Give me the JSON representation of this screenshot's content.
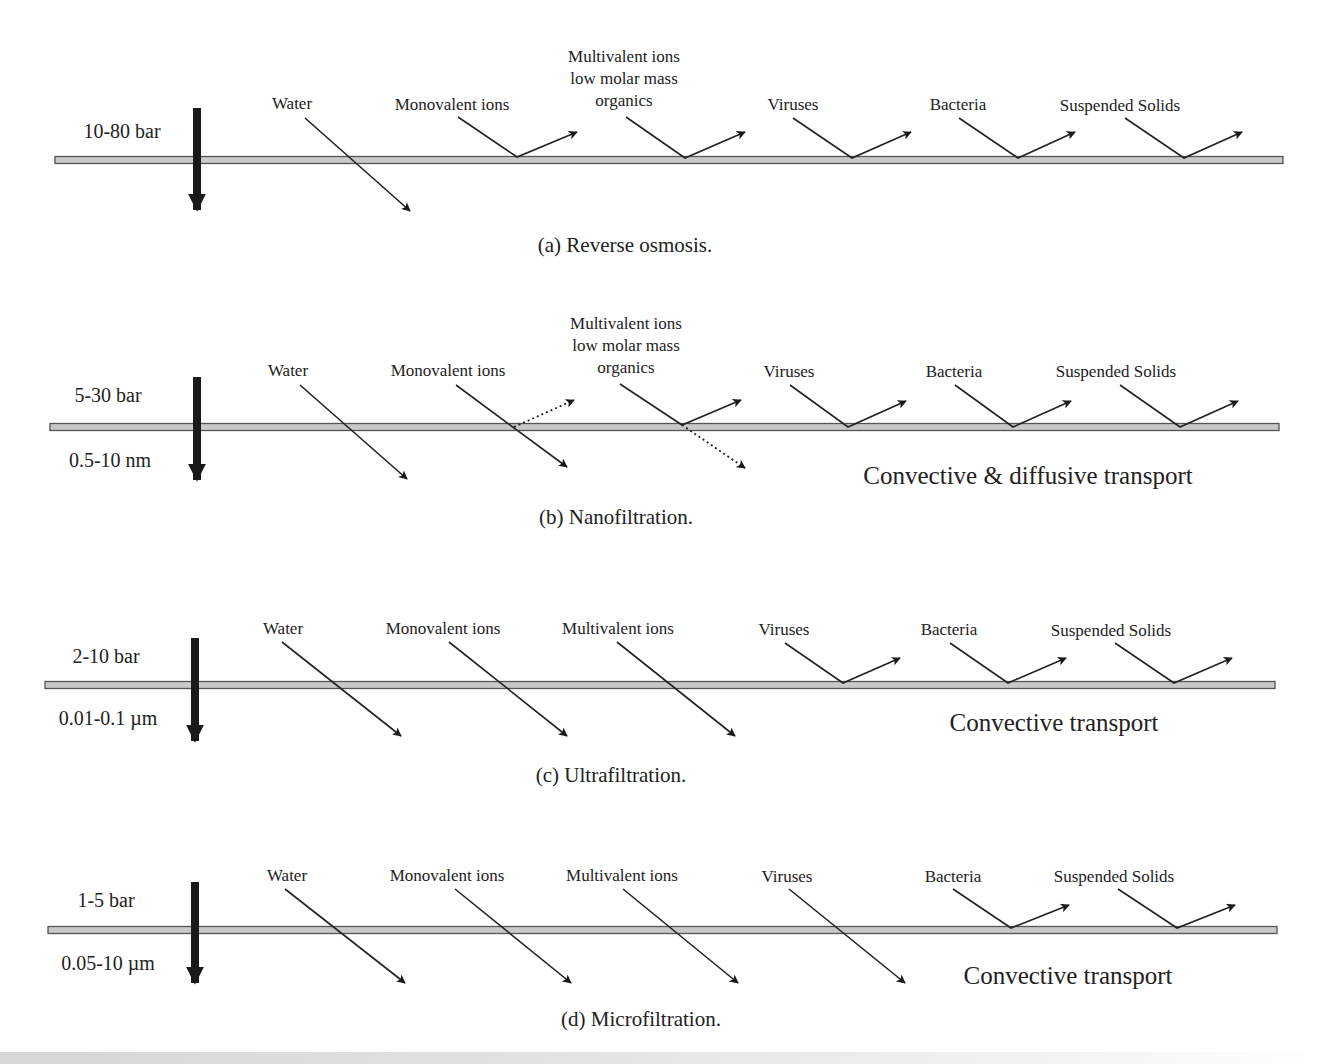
{
  "figure": {
    "panels": [
      {
        "id": "a",
        "caption": "(a)  Reverse osmosis.",
        "pressure": "10-80 bar",
        "pore_size": "",
        "transport": "",
        "membrane": {
          "x1": 55,
          "x2": 1283,
          "y": 160
        },
        "feed_arrow": {
          "x": 197,
          "y1": 108,
          "y2": 210
        },
        "caption_pos": {
          "x": 625,
          "y": 252
        },
        "species": [
          {
            "label": [
              "Water"
            ],
            "label_x": 292,
            "label_y": 109,
            "outcome": "passes",
            "start": [
              305,
              118
            ],
            "cross": [
              347,
              160
            ],
            "end": [
              410,
              211
            ]
          },
          {
            "label": [
              "Monovalent ions"
            ],
            "label_x": 452,
            "label_y": 110,
            "outcome": "rejected",
            "start": [
              458,
              117
            ],
            "cross": [
              517,
              157
            ],
            "end": [
              577,
              132
            ]
          },
          {
            "label": [
              "Multivalent  ions",
              "low molar mass",
              "organics"
            ],
            "label_x": 624,
            "label_y": 62,
            "outcome": "rejected",
            "start": [
              626,
              117
            ],
            "cross": [
              685,
              158
            ],
            "end": [
              745,
              132
            ]
          },
          {
            "label": [
              "Viruses"
            ],
            "label_x": 793,
            "label_y": 110,
            "outcome": "rejected",
            "start": [
              793,
              118
            ],
            "cross": [
              852,
              158
            ],
            "end": [
              911,
              132
            ]
          },
          {
            "label": [
              "Bacteria"
            ],
            "label_x": 958,
            "label_y": 110,
            "outcome": "rejected",
            "start": [
              959,
              118
            ],
            "cross": [
              1018,
              158
            ],
            "end": [
              1075,
              132
            ]
          },
          {
            "label": [
              "Suspended Solids"
            ],
            "label_x": 1120,
            "label_y": 111,
            "outcome": "rejected",
            "start": [
              1125,
              118
            ],
            "cross": [
              1184,
              158
            ],
            "end": [
              1242,
              132
            ]
          }
        ]
      },
      {
        "id": "b",
        "caption": "(b)  Nanofiltration.",
        "pressure": "5-30 bar",
        "pore_size": "0.5-10 nm",
        "transport": "Convective & diffusive transport",
        "transport_pos": {
          "x": 1028,
          "y": 484
        },
        "membrane": {
          "x1": 50,
          "x2": 1279,
          "y": 427
        },
        "feed_arrow": {
          "x": 197,
          "y1": 377,
          "y2": 480
        },
        "caption_pos": {
          "x": 616,
          "y": 524
        },
        "species": [
          {
            "label": [
              "Water"
            ],
            "label_x": 288,
            "label_y": 376,
            "outcome": "passes",
            "start": [
              300,
              385
            ],
            "cross": [
              343,
              427
            ],
            "end": [
              407,
              479
            ]
          },
          {
            "label": [
              "Monovalent ions"
            ],
            "label_x": 448,
            "label_y": 376,
            "outcome": "partial-pass",
            "start": [
              456,
              385
            ],
            "cross": [
              514,
              427
            ],
            "end": [
              567,
              467
            ],
            "dotted_end": [
              574,
              400
            ]
          },
          {
            "label": [
              "Multivalent  ions",
              "low molar mass",
              "organics"
            ],
            "label_x": 626,
            "label_y": 329,
            "outcome": "partial-reject",
            "start": [
              620,
              384
            ],
            "cross": [
              682,
              425
            ],
            "end": [
              741,
              400
            ],
            "dotted_end": [
              745,
              468
            ]
          },
          {
            "label": [
              "Viruses"
            ],
            "label_x": 789,
            "label_y": 377,
            "outcome": "rejected",
            "start": [
              790,
              385
            ],
            "cross": [
              848,
              427
            ],
            "end": [
              906,
              401
            ]
          },
          {
            "label": [
              "Bacteria"
            ],
            "label_x": 954,
            "label_y": 377,
            "outcome": "rejected",
            "start": [
              955,
              385
            ],
            "cross": [
              1013,
              427
            ],
            "end": [
              1071,
              401
            ]
          },
          {
            "label": [
              "Suspended Solids"
            ],
            "label_x": 1116,
            "label_y": 377,
            "outcome": "rejected",
            "start": [
              1120,
              385
            ],
            "cross": [
              1180,
              427
            ],
            "end": [
              1238,
              401
            ]
          }
        ]
      },
      {
        "id": "c",
        "caption": "(c)  Ultrafiltration.",
        "pressure": "2-10 bar",
        "pore_size": "0.01-0.1  µm",
        "transport": "Convective transport",
        "transport_pos": {
          "x": 1054,
          "y": 731
        },
        "membrane": {
          "x1": 45,
          "x2": 1275,
          "y": 685
        },
        "feed_arrow": {
          "x": 195,
          "y1": 638,
          "y2": 741
        },
        "caption_pos": {
          "x": 611,
          "y": 782
        },
        "species": [
          {
            "label": [
              "Water"
            ],
            "label_x": 283,
            "label_y": 634,
            "outcome": "passes",
            "start": [
              282,
              642
            ],
            "cross": [
              328,
              685
            ],
            "end": [
              401,
              736
            ]
          },
          {
            "label": [
              "Monovalent ions"
            ],
            "label_x": 443,
            "label_y": 634,
            "outcome": "passes",
            "start": [
              449,
              642
            ],
            "cross": [
              494,
              685
            ],
            "end": [
              567,
              736
            ]
          },
          {
            "label": [
              "Multivalent  ions"
            ],
            "label_x": 618,
            "label_y": 634,
            "outcome": "passes",
            "start": [
              617,
              642
            ],
            "cross": [
              661,
              685
            ],
            "end": [
              735,
              736
            ]
          },
          {
            "label": [
              "Viruses"
            ],
            "label_x": 784,
            "label_y": 635,
            "outcome": "rejected",
            "start": [
              785,
              643
            ],
            "cross": [
              843,
              683
            ],
            "end": [
              900,
              658
            ]
          },
          {
            "label": [
              "Bacteria"
            ],
            "label_x": 949,
            "label_y": 635,
            "outcome": "rejected",
            "start": [
              950,
              643
            ],
            "cross": [
              1008,
              683
            ],
            "end": [
              1066,
              658
            ]
          },
          {
            "label": [
              "Suspended Solids"
            ],
            "label_x": 1111,
            "label_y": 636,
            "outcome": "rejected",
            "start": [
              1115,
              643
            ],
            "cross": [
              1174,
              683
            ],
            "end": [
              1232,
              658
            ]
          }
        ]
      },
      {
        "id": "d",
        "caption": "(d)  Microfiltration.",
        "pressure": "1-5 bar",
        "pore_size": "0.05-10 µm",
        "transport": "Convective transport",
        "transport_pos": {
          "x": 1068,
          "y": 984
        },
        "membrane": {
          "x1": 48,
          "x2": 1277,
          "y": 930
        },
        "feed_arrow": {
          "x": 195,
          "y1": 882,
          "y2": 983
        },
        "caption_pos": {
          "x": 641,
          "y": 1026
        },
        "species": [
          {
            "label": [
              "Water"
            ],
            "label_x": 287,
            "label_y": 881,
            "outcome": "passes",
            "start": [
              285,
              889
            ],
            "cross": [
              332,
              930
            ],
            "end": [
              405,
              983
            ]
          },
          {
            "label": [
              "Monovalent ions"
            ],
            "label_x": 447,
            "label_y": 881,
            "outcome": "passes",
            "start": [
              455,
              889
            ],
            "cross": [
              499,
              930
            ],
            "end": [
              571,
              983
            ]
          },
          {
            "label": [
              "Multivalent  ions"
            ],
            "label_x": 622,
            "label_y": 881,
            "outcome": "passes",
            "start": [
              623,
              889
            ],
            "cross": [
              666,
              930
            ],
            "end": [
              738,
              983
            ]
          },
          {
            "label": [
              "Viruses"
            ],
            "label_x": 787,
            "label_y": 882,
            "outcome": "passes",
            "start": [
              789,
              889
            ],
            "cross": [
              833,
              930
            ],
            "end": [
              905,
              983
            ]
          },
          {
            "label": [
              "Bacteria"
            ],
            "label_x": 953,
            "label_y": 882,
            "outcome": "rejected",
            "start": [
              953,
              889
            ],
            "cross": [
              1011,
              928
            ],
            "end": [
              1069,
              905
            ]
          },
          {
            "label": [
              "Suspended Solids"
            ],
            "label_x": 1114,
            "label_y": 882,
            "outcome": "rejected",
            "start": [
              1118,
              889
            ],
            "cross": [
              1177,
              928
            ],
            "end": [
              1235,
              905
            ]
          }
        ]
      }
    ],
    "colors": {
      "line": "#222222",
      "membrane_fill": "#c8c8c8",
      "membrane_stroke": "#555555",
      "feed_arrow": "#1a1a1a",
      "text": "#222222"
    }
  }
}
